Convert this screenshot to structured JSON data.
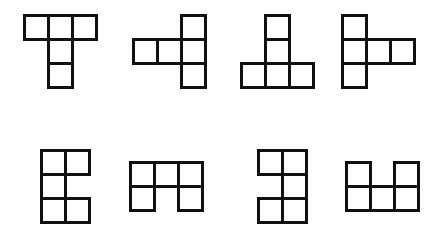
{
  "diagram": {
    "title": "",
    "cell_size": 24,
    "line_color": "#111111",
    "background": "#ffffff",
    "shapes": [
      {
        "id": 1,
        "origin": [
          23,
          14
        ],
        "cells": [
          [
            0,
            0
          ],
          [
            1,
            0
          ],
          [
            2,
            0
          ],
          [
            1,
            1
          ],
          [
            1,
            2
          ]
        ]
      },
      {
        "id": 2,
        "origin": [
          132,
          14
        ],
        "cells": [
          [
            2,
            0
          ],
          [
            0,
            1
          ],
          [
            1,
            1
          ],
          [
            2,
            1
          ],
          [
            2,
            2
          ]
        ]
      },
      {
        "id": 3,
        "origin": [
          240,
          14
        ],
        "cells": [
          [
            1,
            0
          ],
          [
            1,
            1
          ],
          [
            0,
            2
          ],
          [
            1,
            2
          ],
          [
            2,
            2
          ]
        ]
      },
      {
        "id": 4,
        "origin": [
          341,
          14
        ],
        "cells": [
          [
            0,
            0
          ],
          [
            0,
            1
          ],
          [
            1,
            1
          ],
          [
            2,
            1
          ],
          [
            0,
            2
          ]
        ]
      },
      {
        "id": 5,
        "origin": [
          40,
          149
        ],
        "cells": [
          [
            0,
            0
          ],
          [
            1,
            0
          ],
          [
            0,
            1
          ],
          [
            0,
            2
          ],
          [
            1,
            2
          ]
        ]
      },
      {
        "id": 6,
        "origin": [
          129,
          161
        ],
        "cells": [
          [
            0,
            0
          ],
          [
            1,
            0
          ],
          [
            2,
            0
          ],
          [
            0,
            1
          ],
          [
            2,
            1
          ]
        ]
      },
      {
        "id": 7,
        "origin": [
          257,
          149
        ],
        "cells": [
          [
            0,
            0
          ],
          [
            1,
            0
          ],
          [
            1,
            1
          ],
          [
            0,
            2
          ],
          [
            1,
            2
          ]
        ]
      },
      {
        "id": 8,
        "origin": [
          345,
          161
        ],
        "cells": [
          [
            0,
            0
          ],
          [
            2,
            0
          ],
          [
            0,
            1
          ],
          [
            1,
            1
          ],
          [
            2,
            1
          ]
        ]
      }
    ]
  }
}
